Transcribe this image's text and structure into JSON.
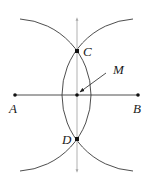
{
  "diagram": {
    "type": "perpendicular-bisector-construction",
    "colors": {
      "stroke": "#3a3a3a",
      "bisector": "#a8a8a8",
      "point": "#111111",
      "background": "#ffffff"
    },
    "segment": {
      "from": "A",
      "to": "B"
    },
    "points": [
      {
        "id": "A",
        "label": "A",
        "x": 15,
        "y": 95,
        "label_x": 9,
        "label_y": 113
      },
      {
        "id": "B",
        "label": "B",
        "x": 138,
        "y": 95,
        "label_x": 133,
        "label_y": 113
      },
      {
        "id": "C",
        "label": "C",
        "x": 77,
        "y": 51,
        "label_x": 83,
        "label_y": 56
      },
      {
        "id": "D",
        "label": "D",
        "x": 77,
        "y": 139,
        "label_x": 62,
        "label_y": 144
      },
      {
        "id": "M",
        "label": "M",
        "x": 77,
        "y": 95,
        "label_x": 113,
        "label_y": 74
      }
    ],
    "arcs": [
      {
        "center": "A",
        "radius": 76
      },
      {
        "center": "B",
        "radius": 76
      }
    ],
    "bisector_line": {
      "x": 77,
      "y_top": 17,
      "y_bottom": 173,
      "arrows": "both"
    },
    "annotation_arrow": {
      "from": [
        106,
        73
      ],
      "to": [
        80,
        92
      ],
      "target": "M"
    }
  }
}
